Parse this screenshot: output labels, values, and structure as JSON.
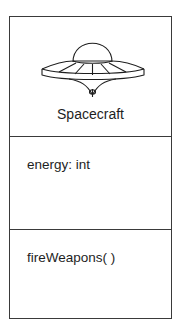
{
  "uml_class": {
    "icon": "ufo-spacecraft-icon",
    "name": "Spacecraft",
    "attributes": [
      "energy: int"
    ],
    "operations": [
      "fireWeapons( )"
    ]
  },
  "colors": {
    "border": "#3a3a3a",
    "text": "#1e1e1e",
    "background": "#ffffff"
  }
}
